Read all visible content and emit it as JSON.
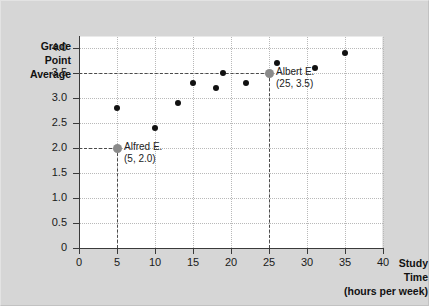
{
  "chart_data": {
    "type": "scatter",
    "title": "",
    "xlabel": "Study Time (hours per week)",
    "ylabel": "Grade Point Average",
    "xlabel_lines": [
      "Study",
      "Time",
      "(hours per week)"
    ],
    "ylabel_lines": [
      "Grade",
      "Point",
      "Average"
    ],
    "xlim": [
      0,
      40
    ],
    "ylim": [
      0,
      4.25
    ],
    "grid": true,
    "legend": "none",
    "x_ticks": [
      "0",
      "5",
      "10",
      "15",
      "20",
      "25",
      "30",
      "35",
      "40"
    ],
    "x_tick_values": [
      0,
      5,
      10,
      15,
      20,
      25,
      30,
      35,
      40
    ],
    "y_ticks": [
      "0",
      "0.5",
      "1.0",
      "1.5",
      "2.0",
      "2.5",
      "3.0",
      "3.5",
      "4.0"
    ],
    "y_tick_values": [
      0,
      0.5,
      1.0,
      1.5,
      2.0,
      2.5,
      3.0,
      3.5,
      4.0
    ],
    "points": [
      {
        "x": 5,
        "y": 2.0,
        "highlight": true,
        "label": "Alfred E."
      },
      {
        "x": 5,
        "y": 2.8,
        "highlight": false,
        "label": ""
      },
      {
        "x": 10,
        "y": 2.4,
        "highlight": false,
        "label": ""
      },
      {
        "x": 13,
        "y": 2.9,
        "highlight": false,
        "label": ""
      },
      {
        "x": 15,
        "y": 3.3,
        "highlight": false,
        "label": ""
      },
      {
        "x": 18,
        "y": 3.2,
        "highlight": false,
        "label": ""
      },
      {
        "x": 19,
        "y": 3.5,
        "highlight": false,
        "label": ""
      },
      {
        "x": 22,
        "y": 3.3,
        "highlight": false,
        "label": ""
      },
      {
        "x": 25,
        "y": 3.5,
        "highlight": true,
        "label": "Albert E."
      },
      {
        "x": 26,
        "y": 3.7,
        "highlight": false,
        "label": ""
      },
      {
        "x": 31,
        "y": 3.6,
        "highlight": false,
        "label": ""
      },
      {
        "x": 35,
        "y": 3.9,
        "highlight": false,
        "label": ""
      }
    ],
    "annotations": [
      {
        "name": "alfred",
        "line1": "Alfred E.",
        "line2": "(5, 2.0)",
        "x": 5,
        "y": 2.0
      },
      {
        "name": "albert",
        "line1": "Albert E.",
        "line2": "(25, 3.5)",
        "x": 25,
        "y": 3.5
      }
    ],
    "guides": [
      {
        "name": "alfred-horizontal",
        "orientation": "h",
        "value": 2.0,
        "from": 0,
        "to": 5
      },
      {
        "name": "alfred-vertical",
        "orientation": "v",
        "value": 5,
        "from": 0,
        "to": 2.0
      },
      {
        "name": "albert-horizontal",
        "orientation": "h",
        "value": 3.5,
        "from": 0,
        "to": 25
      },
      {
        "name": "albert-vertical",
        "orientation": "v",
        "value": 25,
        "from": 0,
        "to": 3.5
      }
    ],
    "colors": {
      "point": "#111111",
      "point_highlight": "#8a8a8a",
      "grid": "#b9b9b9",
      "axis": "#3a3a3a",
      "plot_background": "#ffffff",
      "figure_background": "#d6d6d6"
    }
  }
}
